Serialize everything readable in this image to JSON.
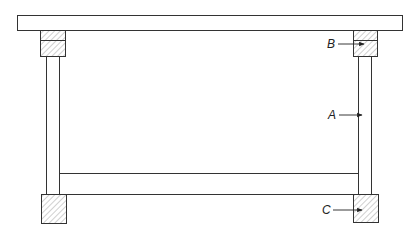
{
  "diagram": {
    "type": "structural frame cross-section",
    "labels": {
      "A": "A",
      "B": "B",
      "C": "C"
    },
    "colors": {
      "line": "#333333",
      "hatch": "#666666",
      "background": "#ffffff"
    }
  }
}
